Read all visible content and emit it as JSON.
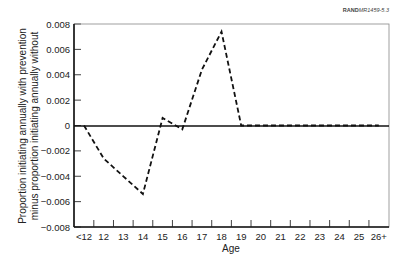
{
  "source_label": {
    "bold": "RAND",
    "rest": "MR1459-5.3"
  },
  "chart_data": {
    "type": "line",
    "title": "",
    "xlabel": "Age",
    "ylabel": [
      "Proportion initiating annually with prevention",
      "minus proportion initiating annually without"
    ],
    "categories": [
      "<12",
      "12",
      "13",
      "14",
      "15",
      "16",
      "17",
      "18",
      "19",
      "20",
      "21",
      "22",
      "23",
      "24",
      "25",
      "26+"
    ],
    "series": [
      {
        "name": "Difference in initiation",
        "style": "dashed",
        "values": [
          0.0,
          -0.0026,
          -0.004,
          -0.0054,
          0.0006,
          -0.0003,
          0.0044,
          0.0074,
          0.0,
          0.0,
          0.0,
          0.0,
          0.0,
          0.0,
          0.0,
          0.0
        ]
      }
    ],
    "yticks": [
      "0.008",
      "0.006",
      "0.004",
      "0.002",
      "0",
      "-0.002",
      "-0.004",
      "-0.006",
      "-0.008"
    ],
    "ylim": [
      -0.008,
      0.008
    ],
    "zero_line": true,
    "grid": false,
    "legend": "none"
  }
}
